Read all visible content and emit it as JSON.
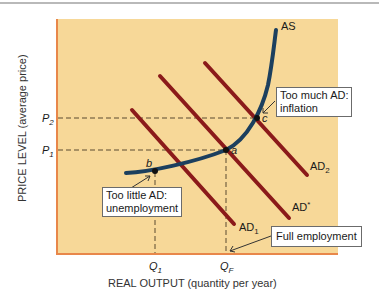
{
  "figure": {
    "x_axis_label": "REAL OUTPUT (quantity per year)",
    "y_axis_label": "PRICE LEVEL (average price)",
    "y_ticks": [
      {
        "label": "P",
        "sub": "2"
      },
      {
        "label": "P",
        "sub": "1"
      }
    ],
    "x_ticks": [
      {
        "label": "Q",
        "sub": "1"
      },
      {
        "label": "Q",
        "sub": "F"
      }
    ],
    "curves": {
      "as": {
        "label": "AS",
        "color": "#1c3f5e"
      },
      "ad1": {
        "label": "AD",
        "sub": "1",
        "color": "#8b1a1a"
      },
      "ad_star": {
        "label": "AD",
        "sup": "*",
        "color": "#8b1a1a"
      },
      "ad2": {
        "label": "AD",
        "sub": "2",
        "color": "#8b1a1a"
      }
    },
    "points": {
      "a": "a",
      "b": "b",
      "c": "c"
    },
    "callouts": {
      "inflation": [
        "Too much AD:",
        "inflation"
      ],
      "unemployment": [
        "Too little AD:",
        "unemployment"
      ],
      "full_employment": "Full employment"
    },
    "colors": {
      "plot_fill": "#f7d898",
      "plot_border": "#e8874a",
      "dash": "#6b5a3a"
    }
  }
}
